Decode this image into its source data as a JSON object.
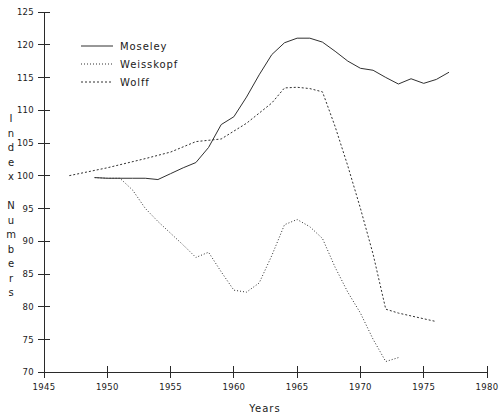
{
  "chart_data": {
    "type": "line",
    "title": "",
    "xlabel": "Years",
    "ylabel": "Index Numbers",
    "xlim": [
      1945,
      1980
    ],
    "ylim": [
      70,
      125
    ],
    "xticks": [
      1945,
      1950,
      1955,
      1960,
      1965,
      1970,
      1975,
      1980
    ],
    "yticks": [
      70,
      75,
      80,
      85,
      90,
      95,
      100,
      105,
      110,
      115,
      120,
      125
    ],
    "grid": false,
    "legend_position": "upper-left-inside",
    "series": [
      {
        "name": "Moseley",
        "style": "solid",
        "color": "#303030",
        "x": [
          1949,
          1950,
          1951,
          1952,
          1953,
          1954,
          1955,
          1956,
          1957,
          1958,
          1959,
          1960,
          1961,
          1962,
          1963,
          1964,
          1965,
          1966,
          1967,
          1968,
          1969,
          1970,
          1971,
          1972,
          1973,
          1974,
          1975,
          1976,
          1977
        ],
        "values": [
          99.7,
          99.6,
          99.6,
          99.6,
          99.6,
          99.4,
          100.3,
          101.2,
          102.0,
          104.3,
          107.8,
          109.0,
          112.0,
          115.4,
          118.5,
          120.3,
          121.0,
          121.0,
          120.4,
          119.0,
          117.5,
          116.4,
          116.1,
          115.0,
          114.0,
          114.8,
          114.1,
          114.7,
          115.8
        ]
      },
      {
        "name": "Weisskopf",
        "style": "dotted",
        "color": "#303030",
        "x": [
          1949,
          1950,
          1951,
          1952,
          1953,
          1954,
          1955,
          1956,
          1957,
          1958,
          1959,
          1960,
          1961,
          1962,
          1963,
          1964,
          1965,
          1966,
          1967,
          1968,
          1969,
          1970,
          1971,
          1972,
          1973
        ],
        "values": [
          99.7,
          99.6,
          99.6,
          97.8,
          95.0,
          93.0,
          91.2,
          89.4,
          87.5,
          88.3,
          85.3,
          82.5,
          82.2,
          83.6,
          87.8,
          92.5,
          93.3,
          92.2,
          90.4,
          86.0,
          82.2,
          79.0,
          75.0,
          71.6,
          72.2
        ]
      },
      {
        "name": "Wolff",
        "style": "dashed",
        "color": "#303030",
        "x": [
          1947,
          1950,
          1953,
          1955,
          1957,
          1959,
          1961,
          1963,
          1964,
          1965,
          1966,
          1967,
          1968,
          1969,
          1970,
          1971,
          1972,
          1973,
          1976
        ],
        "values": [
          100.0,
          101.2,
          102.6,
          103.6,
          105.2,
          105.6,
          108.0,
          111.1,
          113.4,
          113.5,
          113.3,
          112.8,
          107.5,
          101.5,
          95.0,
          88.0,
          79.6,
          79.0,
          77.7
        ]
      }
    ]
  },
  "legend": {
    "entries": [
      {
        "label": "Moseley",
        "style": "solid"
      },
      {
        "label": "Weisskopf",
        "style": "dotted"
      },
      {
        "label": "Wolff",
        "style": "dashed"
      }
    ]
  },
  "axes": {
    "x_title": "Years",
    "y_title_chars": [
      "I",
      "n",
      "d",
      "e",
      "x",
      "",
      "N",
      "u",
      "m",
      "b",
      "e",
      "r",
      "s"
    ],
    "x_tick_labels": [
      "1945",
      "1950",
      "1955",
      "1960",
      "1965",
      "1970",
      "1975",
      "1980"
    ],
    "y_tick_labels": [
      "125",
      "120",
      "115",
      "110",
      "105",
      "100",
      "95",
      "90",
      "85",
      "80",
      "75",
      "70"
    ]
  }
}
